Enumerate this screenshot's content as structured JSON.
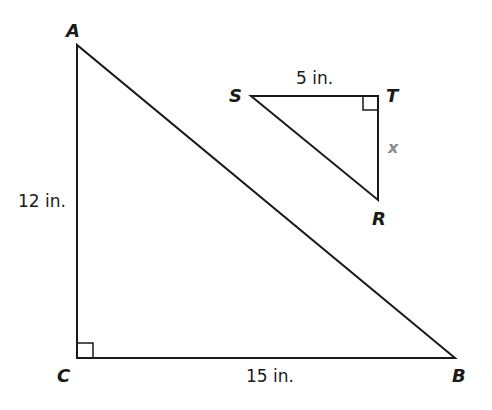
{
  "diagram": {
    "type": "two right triangles",
    "large_triangle": {
      "vertices": {
        "A": "A",
        "B": "B",
        "C": "C"
      },
      "right_angle_at": "C",
      "sides": {
        "AC": "12 in.",
        "CB": "15 in."
      }
    },
    "small_triangle": {
      "vertices": {
        "S": "S",
        "T": "T",
        "R": "R"
      },
      "right_angle_at": "T",
      "sides": {
        "ST": "5 in.",
        "TR": "x"
      }
    },
    "colors": {
      "stroke": "#1a1a1a",
      "variable": "#8a8a8a",
      "background": "#ffffff"
    }
  }
}
